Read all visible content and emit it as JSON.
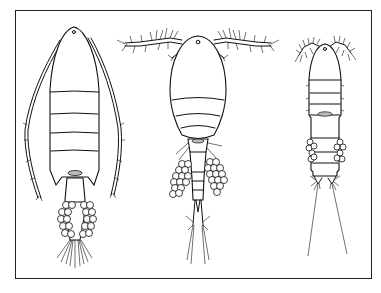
{
  "figure": {
    "panels": [
      {
        "id": "calanoid",
        "label": "",
        "features": [
          "long segmented antennules",
          "elongate prosome",
          "single egg sac"
        ]
      },
      {
        "id": "cyclopoid",
        "label": "",
        "features": [
          "short setose antennules",
          "oval prosome",
          "paired egg sacs"
        ]
      },
      {
        "id": "harpacticoid",
        "label": "",
        "features": [
          "very short antennules",
          "narrow cylindrical body",
          "paired small egg sacs",
          "long caudal setae"
        ]
      }
    ],
    "colors": {
      "line": "#111111",
      "background": "#ffffff",
      "frame": "#222222"
    }
  }
}
